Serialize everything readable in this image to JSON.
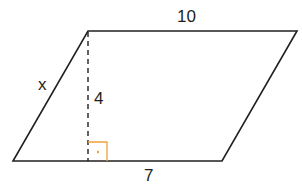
{
  "diagram": {
    "type": "parallelogram",
    "labels": {
      "top_side": "10",
      "left_side": "x",
      "height": "4",
      "bottom_segment": "7"
    },
    "vertices": {
      "top_left": [
        88,
        31
      ],
      "top_right": [
        297,
        31
      ],
      "bottom_right": [
        222,
        161
      ],
      "bottom_left": [
        13,
        161
      ]
    },
    "height_line": {
      "from": [
        88,
        31
      ],
      "to": [
        88,
        161
      ],
      "style": "dashed"
    },
    "right_angle_marker": {
      "x": 88,
      "y": 142,
      "size": 19,
      "color": "#f0a040"
    },
    "colors": {
      "stroke": "#231f20",
      "marker": "#f0a040"
    }
  }
}
